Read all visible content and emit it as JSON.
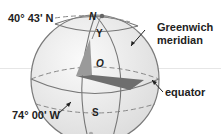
{
  "diagram": {
    "labels": {
      "latitude": "40° 43' N",
      "longitude": "74° 00' W",
      "greenwich_line1": "Greenwich",
      "greenwich_line2": "meridian",
      "equator": "equator"
    },
    "points": {
      "north": "N",
      "south": "S",
      "y": "Y",
      "origin": "O"
    },
    "colors": {
      "sphere_fill": "#f0f0f0",
      "outline": "#777777",
      "wedge_dark": "#6e6e6e",
      "wedge_mid": "#9a9a9a",
      "text": "#222222"
    }
  }
}
